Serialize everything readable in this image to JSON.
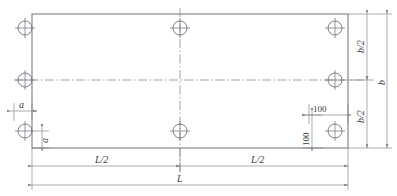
{
  "drawing": {
    "title": "Rectangular base plate hole layout",
    "colors": {
      "outline": "#6e6e78",
      "dimension": "#8a8a92",
      "centerline": "#8a8a92",
      "text": "#3a3a3a",
      "background": "#ffffff"
    },
    "plate": {
      "shape": "rectangle",
      "x": 32,
      "y": 14,
      "width": 316,
      "height": 134
    },
    "holes": [
      {
        "name": "hole-top-left",
        "cx": 25,
        "cy": 28,
        "r": 7
      },
      {
        "name": "hole-top-center",
        "cx": 180,
        "cy": 28,
        "r": 7
      },
      {
        "name": "hole-top-right",
        "cx": 335,
        "cy": 28,
        "r": 7
      },
      {
        "name": "hole-mid-left",
        "cx": 25,
        "cy": 80,
        "r": 7
      },
      {
        "name": "hole-mid-right",
        "cx": 335,
        "cy": 80,
        "r": 7
      },
      {
        "name": "hole-bottom-left",
        "cx": 25,
        "cy": 131,
        "r": 7
      },
      {
        "name": "hole-bottom-center",
        "cx": 180,
        "cy": 131,
        "r": 7
      },
      {
        "name": "hole-bottom-right",
        "cx": 335,
        "cy": 131,
        "r": 7
      }
    ],
    "dimensions": {
      "edge_offset_horizontal": "a",
      "edge_offset_vertical": "a",
      "hole_inset_horizontal": "100",
      "hole_inset_vertical": "100",
      "half_width_top": "b/2",
      "half_width_bottom": "b/2",
      "full_width": "b",
      "half_length_left": "L/2",
      "half_length_right": "L/2",
      "full_length": "L"
    }
  }
}
